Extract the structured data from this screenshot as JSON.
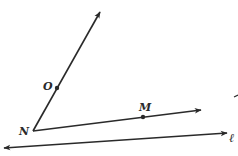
{
  "diagram": {
    "points": {
      "N": {
        "label": "N"
      },
      "O": {
        "label": "O"
      },
      "M": {
        "label": "M"
      }
    },
    "line_label": "ℓ",
    "stroke_color": "#2a2a2a",
    "background": "#ffffff"
  }
}
